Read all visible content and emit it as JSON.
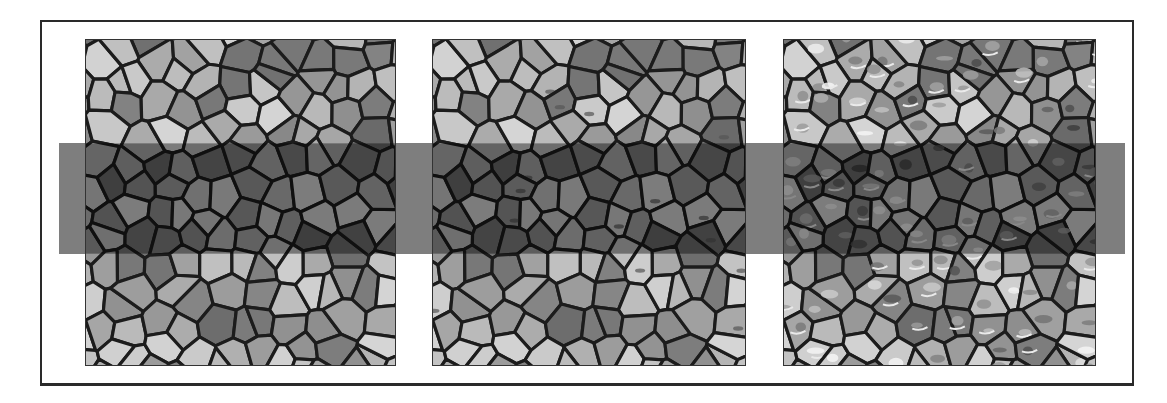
{
  "figure": {
    "frame": {
      "x": 40,
      "y": 20,
      "width": 1094,
      "height": 366,
      "border_color": "#2a2a2a"
    },
    "band": {
      "x": 59,
      "y": 143,
      "width": 1066,
      "height": 111,
      "color": "#7e7e7e",
      "overlay_opacity": 0.42
    },
    "cell_outline_color": "#1c1c1c",
    "panels": [
      {
        "id": "panel-1",
        "x": 85,
        "width": 311,
        "seed": 11,
        "texture": "plain"
      },
      {
        "id": "panel-2",
        "x": 432,
        "width": 314,
        "seed": 11,
        "texture": "slight"
      },
      {
        "id": "panel-3",
        "x": 783,
        "width": 313,
        "seed": 11,
        "texture": "speckled"
      }
    ],
    "panel_top": 39,
    "panel_height": 327,
    "cell_grid": {
      "cols": 11,
      "rows": 12,
      "jitter": 0.42
    },
    "gray_range": {
      "min": 105,
      "max": 215
    }
  }
}
